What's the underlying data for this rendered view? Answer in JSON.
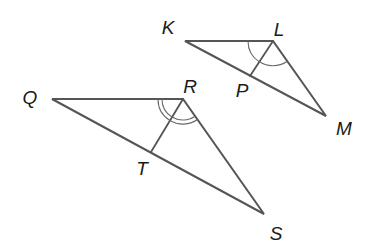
{
  "diagram": {
    "triangles": [
      {
        "name": "triangle-KLM",
        "vertices": {
          "K": {
            "label": "K",
            "x": 185,
            "y": 41,
            "lx": 168,
            "ly": 27
          },
          "L": {
            "label": "L",
            "x": 273,
            "y": 41,
            "lx": 279,
            "ly": 29
          },
          "M": {
            "label": "M",
            "x": 326,
            "y": 116,
            "lx": 344,
            "ly": 128
          }
        },
        "bisector": {
          "from": "L",
          "to": "P",
          "point": {
            "label": "P",
            "x": 250,
            "y": 76,
            "lx": 242,
            "ly": 90
          }
        },
        "angle_marks": "single arcs at L marking congruent halves"
      },
      {
        "name": "triangle-QRS",
        "vertices": {
          "Q": {
            "label": "Q",
            "x": 52,
            "y": 99,
            "lx": 30,
            "ly": 97
          },
          "R": {
            "label": "R",
            "x": 183,
            "y": 99,
            "lx": 190,
            "ly": 86
          },
          "S": {
            "label": "S",
            "x": 264,
            "y": 214,
            "lx": 276,
            "ly": 233
          }
        },
        "bisector": {
          "from": "R",
          "to": "T",
          "point": {
            "label": "T",
            "x": 151,
            "y": 152,
            "lx": 142,
            "ly": 168
          }
        },
        "angle_marks": "double arcs at R marking congruent halves"
      }
    ]
  },
  "labels": {
    "K": "K",
    "L": "L",
    "M": "M",
    "P": "P",
    "Q": "Q",
    "R": "R",
    "S": "S",
    "T": "T"
  },
  "colors": {
    "line": "#555555",
    "text": "#1a1a1a",
    "background": "#ffffff"
  }
}
